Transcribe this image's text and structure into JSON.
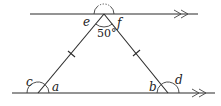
{
  "diagram": {
    "type": "geometry-parallel-lines-isosceles-triangle",
    "parallel_lines": [
      {
        "name": "top-line",
        "arrow_marker": "double-chevron"
      },
      {
        "name": "bottom-line",
        "arrow_marker": "double-chevron"
      }
    ],
    "triangle": {
      "equal_sides_marked": true,
      "apex_angle_label": "50°"
    },
    "angle_labels": {
      "e": "e",
      "f": "f",
      "a": "a",
      "b": "b",
      "c": "c",
      "d": "d",
      "apex": "50°"
    },
    "colors": {
      "stroke": "#2a2a2a",
      "background": "#ffffff"
    }
  }
}
